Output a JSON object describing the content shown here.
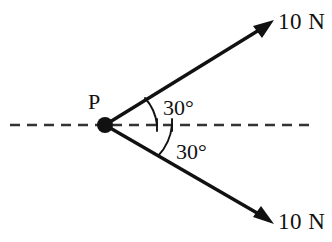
{
  "diagram": {
    "canvas": {
      "width": 332,
      "height": 242,
      "background": "#ffffff"
    },
    "ink_color": "#111111",
    "axis_color": "#333333",
    "origin": {
      "label": "P",
      "x": 105,
      "y": 125,
      "dot_radius": 8
    },
    "axis": {
      "name": "horizontal-reference-line",
      "style": "dashed",
      "x_start": 10,
      "x_end": 316,
      "y": 125
    },
    "vectors": [
      {
        "id": "upper-force",
        "label": "10 N",
        "magnitude": 10,
        "unit": "N",
        "angle_deg": 30,
        "direction": "above-horizontal",
        "start_x": 105,
        "start_y": 125,
        "tip_x": 272,
        "tip_y": 22,
        "label_x": 278,
        "label_y": 29
      },
      {
        "id": "lower-force",
        "label": "10 N",
        "magnitude": 10,
        "unit": "N",
        "angle_deg": 30,
        "direction": "below-horizontal",
        "start_x": 105,
        "start_y": 125,
        "tip_x": 272,
        "tip_y": 222,
        "label_x": 278,
        "label_y": 229
      }
    ],
    "angles": [
      {
        "id": "upper-angle",
        "label": "30°",
        "value": 30,
        "unit": "degree",
        "label_x": 163,
        "label_y": 114
      },
      {
        "id": "lower-angle",
        "label": "30°",
        "value": 30,
        "unit": "degree",
        "label_x": 176,
        "label_y": 158
      }
    ]
  }
}
